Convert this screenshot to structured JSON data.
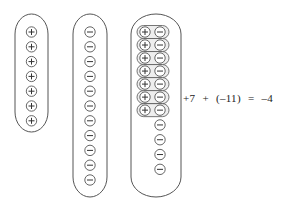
{
  "diagram": {
    "title": "",
    "stroke_color": "#555555",
    "groups": [
      {
        "name": "positive-group",
        "label_count": 7,
        "charges": [
          "+",
          "+",
          "+",
          "+",
          "+",
          "+",
          "+"
        ],
        "box": {
          "x": 15,
          "y": 14,
          "w": 33,
          "h": 118
        }
      },
      {
        "name": "negative-group",
        "label_count": 11,
        "charges": [
          "-",
          "-",
          "-",
          "-",
          "-",
          "-",
          "-",
          "-",
          "-",
          "-",
          "-"
        ],
        "box": {
          "x": 73,
          "y": 14,
          "w": 34,
          "h": 183
        }
      },
      {
        "name": "combined-group",
        "pairs": 7,
        "remaining_negatives": 4,
        "box": {
          "x": 131,
          "y": 14,
          "w": 50,
          "h": 183
        }
      }
    ]
  },
  "equation": {
    "lhs_a": "+7",
    "op_plus": "+",
    "lhs_b": "(–11)",
    "equals": "=",
    "result": "–4"
  }
}
